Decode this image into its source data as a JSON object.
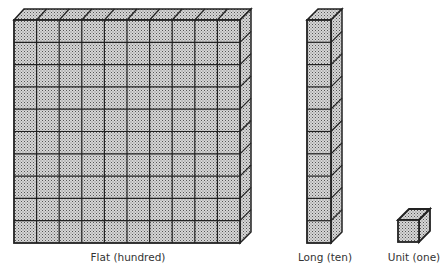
{
  "diagram": {
    "type": "base-ten blocks",
    "colors": {
      "fill": "#bdbdbd",
      "side_fill": "#a8a8a8",
      "top_fill": "#cfcfcf",
      "stroke": "#222222"
    },
    "blocks": [
      {
        "name": "flat",
        "label": "Flat (hundred)",
        "grid": [
          10,
          10
        ]
      },
      {
        "name": "long",
        "label": "Long (ten)",
        "grid": [
          1,
          10
        ]
      },
      {
        "name": "unit",
        "label": "Unit (one)",
        "grid": [
          1,
          1
        ]
      }
    ]
  }
}
